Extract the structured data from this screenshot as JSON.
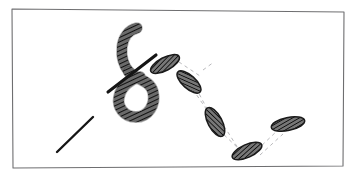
{
  "figure": {
    "background_color": "#ffffff",
    "width": 356,
    "height": 184
  },
  "frame": {
    "name": "hand-drawn-rectangular-border",
    "stroke_color": "#6e6e70",
    "stroke_width": 1.1,
    "points": "12,9 344,12 343,166 13,168"
  },
  "ink": {
    "rope_outline_color": "#1a1a1a",
    "rope_fill_color": "#4a4a4a",
    "hatch_color": "#111111",
    "stick_color": "#151515",
    "dash_guide_color": "#b9b9bc"
  },
  "elements": {
    "loop": {
      "name": "rope-loop-coil",
      "label": "rope coil forming a closed loop",
      "tail_path": "M137,28 C128,30 123,38 122,47 C121,57 124,66 129,72",
      "loop_path": "M129,72 C137,80 150,80 153,92 C156,105 148,117 136,117 C124,117 117,107 119,97 C121,86 131,79 140,77"
    },
    "stick": {
      "name": "straight-stick-through-loop",
      "label": "straight pin crossing the rope",
      "x1": 108,
      "y1": 92,
      "x2": 156,
      "y2": 55
    },
    "free_stroke": {
      "name": "lower-left-diagonal-stroke",
      "label": "short solid diagonal stroke at lower left",
      "x1": 57,
      "y1": 152,
      "x2": 93,
      "y2": 117
    },
    "segments": [
      {
        "name": "rope-segment-1",
        "cx": 165,
        "cy": 64,
        "rx": 16,
        "ry": 6.5,
        "angle": -28
      },
      {
        "name": "rope-segment-2",
        "cx": 189,
        "cy": 82,
        "rx": 15,
        "ry": 6.5,
        "angle": 42
      },
      {
        "name": "rope-segment-3",
        "cx": 215,
        "cy": 122,
        "rx": 16,
        "ry": 7,
        "angle": 62
      },
      {
        "name": "rope-segment-4",
        "cx": 247,
        "cy": 151,
        "rx": 16,
        "ry": 6.5,
        "angle": -24
      },
      {
        "name": "rope-segment-5",
        "cx": 288,
        "cy": 124,
        "rx": 17,
        "ry": 6.5,
        "angle": -12
      }
    ],
    "guides": [
      {
        "name": "dashed-guide-1",
        "x1": 173,
        "y1": 58,
        "x2": 200,
        "y2": 76
      },
      {
        "name": "dashed-guide-2",
        "x1": 181,
        "y1": 72,
        "x2": 209,
        "y2": 113
      },
      {
        "name": "dashed-guide-3",
        "x1": 196,
        "y1": 88,
        "x2": 212,
        "y2": 118
      },
      {
        "name": "dashed-guide-4",
        "x1": 219,
        "y1": 130,
        "x2": 240,
        "y2": 150
      },
      {
        "name": "dashed-guide-5",
        "x1": 224,
        "y1": 126,
        "x2": 243,
        "y2": 156
      },
      {
        "name": "dashed-guide-6",
        "x1": 257,
        "y1": 150,
        "x2": 278,
        "y2": 130
      },
      {
        "name": "dashed-guide-7",
        "x1": 260,
        "y1": 155,
        "x2": 283,
        "y2": 134
      },
      {
        "name": "dashed-guide-8",
        "x1": 203,
        "y1": 70,
        "x2": 214,
        "y2": 62
      }
    ]
  }
}
